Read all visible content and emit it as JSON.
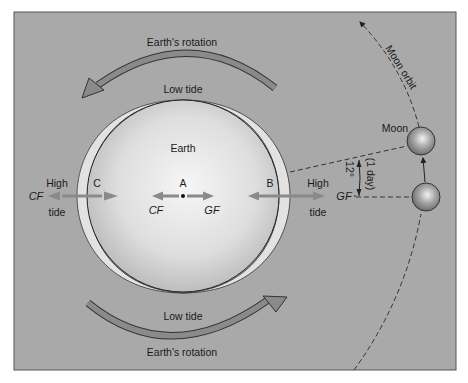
{
  "diagram": {
    "colors": {
      "background": "#a9a9a9",
      "frame_border": "#555555",
      "earth_light": "#f4f4f4",
      "earth_dark": "#b8b8b8",
      "bulge": "#e2e2e2",
      "arrow_fill": "#8a8a8a",
      "dashed_line": "#333333"
    },
    "labels": {
      "rotation_top": "Earth's rotation",
      "rotation_bottom": "Earth's rotation",
      "low_tide_top": "Low tide",
      "low_tide_bottom": "Low tide",
      "earth": "Earth",
      "point_a": "A",
      "point_b": "B",
      "point_c": "C",
      "high_left": "High",
      "tide_left": "tide",
      "high_right": "High",
      "tide_right": "tide",
      "cf_left": "CF",
      "cf_center": "CF",
      "gf_center": "GF",
      "gf_right": "GF",
      "moon": "Moon",
      "moon_orbit": "Moon orbit",
      "angle": "12°",
      "angle_note": "(1 day)"
    }
  }
}
